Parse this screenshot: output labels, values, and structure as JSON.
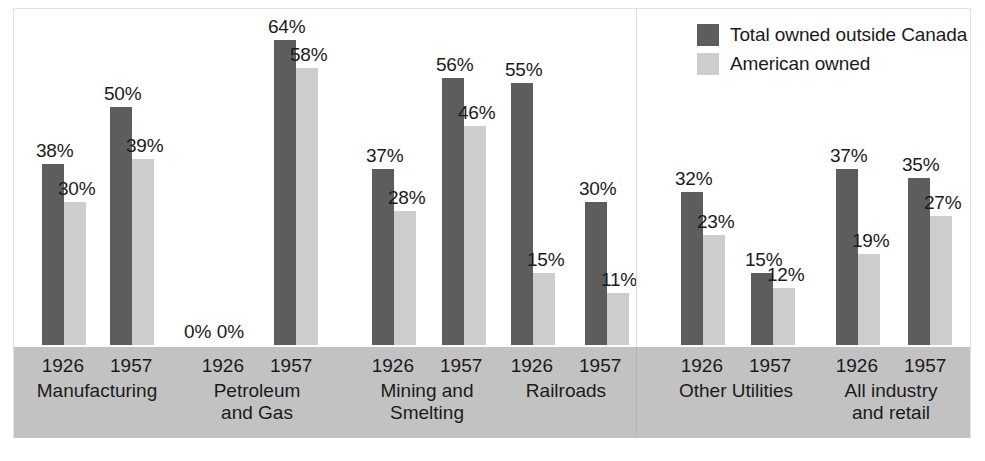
{
  "chart_data": {
    "type": "bar",
    "title": "",
    "subtitle": "",
    "xlabel": "",
    "ylabel": "",
    "ylim": [
      0,
      70
    ],
    "grid": false,
    "legend_position": "top-right",
    "value_suffix": "%",
    "categories": [
      "Manufacturing 1926",
      "Manufacturing 1957",
      "Petroleum and Gas 1926",
      "Petroleum and Gas 1957",
      "Mining and Smelting 1926",
      "Mining and Smelting 1957",
      "Railroads 1926",
      "Railroads 1957",
      "Other Utilities 1926",
      "Other Utilities 1957",
      "All industry and retail 1926",
      "All industry and retail 1957"
    ],
    "series": [
      {
        "name": "Total owned outside Canada",
        "color": "#5d5d5d",
        "values": [
          38,
          50,
          0,
          64,
          37,
          56,
          55,
          30,
          32,
          15,
          37,
          35
        ]
      },
      {
        "name": "American owned",
        "color": "#cdcdcd",
        "values": [
          30,
          39,
          0,
          58,
          28,
          46,
          15,
          11,
          23,
          12,
          19,
          27
        ]
      }
    ],
    "groups": [
      {
        "name": "Manufacturing",
        "years": [
          "1926",
          "1957"
        ],
        "pairs": [
          {
            "year": "1926",
            "total": 38,
            "total_label": "38%",
            "american": 30,
            "american_label": "30%"
          },
          {
            "year": "1957",
            "total": 50,
            "total_label": "50%",
            "american": 39,
            "american_label": "39%"
          }
        ]
      },
      {
        "name": "Petroleum\nand Gas",
        "years": [
          "1926",
          "1957"
        ],
        "pairs": [
          {
            "year": "1926",
            "total": 0,
            "total_label": "0%",
            "american": 0,
            "american_label": "0%"
          },
          {
            "year": "1957",
            "total": 64,
            "total_label": "64%",
            "american": 58,
            "american_label": "58%"
          }
        ]
      },
      {
        "name": "Mining and\nSmelting",
        "years": [
          "1926",
          "1957"
        ],
        "pairs": [
          {
            "year": "1926",
            "total": 37,
            "total_label": "37%",
            "american": 28,
            "american_label": "28%"
          },
          {
            "year": "1957",
            "total": 56,
            "total_label": "56%",
            "american": 46,
            "american_label": "46%"
          }
        ]
      },
      {
        "name": "Railroads",
        "years": [
          "1926",
          "1957"
        ],
        "pairs": [
          {
            "year": "1926",
            "total": 55,
            "total_label": "55%",
            "american": 15,
            "american_label": "15%"
          },
          {
            "year": "1957",
            "total": 30,
            "total_label": "30%",
            "american": 11,
            "american_label": "11%"
          }
        ]
      },
      {
        "name": "Other Utilities",
        "years": [
          "1926",
          "1957"
        ],
        "pairs": [
          {
            "year": "1926",
            "total": 32,
            "total_label": "32%",
            "american": 23,
            "american_label": "23%"
          },
          {
            "year": "1957",
            "total": 15,
            "total_label": "15%",
            "american": 12,
            "american_label": "12%"
          }
        ]
      },
      {
        "name": "All industry\nand retail",
        "years": [
          "1926",
          "1957"
        ],
        "pairs": [
          {
            "year": "1926",
            "total": 37,
            "total_label": "37%",
            "american": 19,
            "american_label": "19%"
          },
          {
            "year": "1957",
            "total": 35,
            "total_label": "35%",
            "american": 27,
            "american_label": "27%"
          }
        ]
      }
    ]
  },
  "legend": {
    "items": [
      {
        "label": "Total owned outside Canada",
        "color": "#5d5d5d",
        "swatch": "total"
      },
      {
        "label": "American owned",
        "color": "#cdcdcd",
        "swatch": "american"
      }
    ]
  },
  "colors": {
    "total_owned": "#5d5d5d",
    "american_owned": "#cdcdcd",
    "label_band": "#c2c2c2",
    "text": "#1b1b1b",
    "frame": "#e2e2e2"
  },
  "zero_pair_text": "0% 0%"
}
